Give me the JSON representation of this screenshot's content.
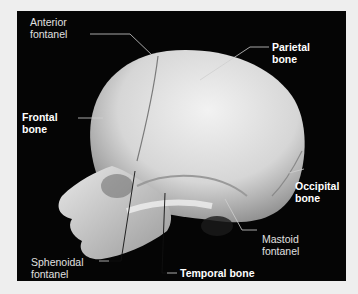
{
  "figure": {
    "background_color": "#050505",
    "bone_color": "#d8d8d8",
    "labels": [
      {
        "id": "anterior-fontanel",
        "line1": "Anterior",
        "line2": "fontanel",
        "bold": false
      },
      {
        "id": "frontal-bone",
        "line1": "Frontal",
        "line2": "bone",
        "bold": true
      },
      {
        "id": "parietal-bone",
        "line1": "Parietal",
        "line2": "bone",
        "bold": true
      },
      {
        "id": "occipital-bone",
        "line1": "Occipital",
        "line2": "bone",
        "bold": true
      },
      {
        "id": "mastoid-fontanel",
        "line1": "Mastoid",
        "line2": "fontanel",
        "bold": false
      },
      {
        "id": "sphenoidal-fontanel",
        "line1": "Sphenoidal",
        "line2": "fontanel",
        "bold": false
      },
      {
        "id": "temporal-bone",
        "line1": "Temporal bone",
        "line2": "(squamous part)",
        "bold": true
      }
    ]
  }
}
